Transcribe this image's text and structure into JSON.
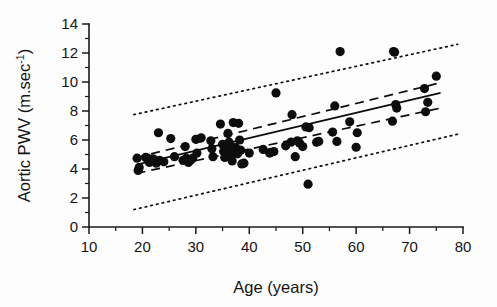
{
  "chart_data": {
    "type": "scatter",
    "title": "",
    "xlabel": "Age (years)",
    "ylabel": "Aortic PWV (m.sec-1)",
    "ylabel_base": "Aortic PWV (m.sec",
    "ylabel_sup": "-1",
    "ylabel_close": ")",
    "xlim": [
      10,
      80
    ],
    "ylim": [
      0,
      14
    ],
    "xticks": [
      10,
      20,
      30,
      40,
      50,
      60,
      70,
      80
    ],
    "xtick_labels": [
      "10",
      "20",
      "30",
      "40",
      "50",
      "60",
      "70",
      "80"
    ],
    "xminor": [
      15,
      25,
      35,
      45,
      55,
      65,
      75
    ],
    "yticks": [
      0,
      2,
      4,
      6,
      8,
      10,
      12,
      14
    ],
    "ytick_labels": [
      "0",
      "2",
      "4",
      "6",
      "8",
      "10",
      "12",
      "14"
    ],
    "yminor": [
      1,
      3,
      5,
      7,
      9,
      11,
      13
    ],
    "grid": false,
    "legend": "none",
    "marker_color": "#0d0d0d",
    "marker_size": 4.6,
    "x": [
      19.0,
      19.2,
      19.4,
      20.6,
      21.0,
      21.3,
      22.0,
      22.3,
      22.6,
      23.0,
      23.2,
      24.0,
      25.3,
      26.0,
      27.6,
      28.0,
      28.2,
      28.6,
      29.0,
      29.4,
      30.0,
      30.2,
      31.0,
      32.8,
      33.0,
      33.2,
      34.6,
      35.0,
      35.2,
      35.4,
      35.8,
      36.0,
      36.2,
      36.4,
      36.6,
      36.8,
      37.0,
      37.4,
      37.8,
      38.0,
      38.2,
      38.4,
      38.6,
      39.0,
      40.0,
      42.6,
      43.8,
      44.0,
      44.6,
      45.0,
      46.8,
      47.8,
      48.0,
      48.6,
      49.0,
      49.4,
      50.0,
      50.6,
      51.0,
      51.2,
      52.6,
      53.0,
      55.6,
      56.0,
      56.4,
      57.0,
      58.8,
      60.0,
      60.2,
      66.8,
      67.0,
      67.2,
      67.4,
      67.6,
      72.8,
      73.0,
      73.4,
      75.0
    ],
    "y": [
      4.75,
      3.9,
      4.1,
      4.8,
      4.75,
      4.45,
      4.7,
      4.55,
      4.4,
      6.5,
      4.6,
      4.5,
      6.1,
      4.85,
      4.6,
      5.55,
      4.75,
      4.45,
      4.6,
      4.75,
      6.05,
      5.1,
      6.15,
      5.95,
      5.4,
      4.85,
      7.1,
      5.7,
      5.2,
      4.8,
      5.25,
      6.45,
      5.85,
      5.45,
      5.0,
      4.55,
      7.2,
      5.5,
      5.05,
      7.15,
      6.0,
      5.3,
      4.35,
      4.4,
      5.1,
      5.35,
      5.1,
      5.15,
      5.2,
      9.25,
      5.6,
      5.85,
      7.75,
      4.85,
      5.95,
      5.8,
      5.55,
      6.9,
      2.95,
      6.85,
      5.85,
      5.9,
      6.55,
      8.35,
      5.9,
      12.1,
      7.25,
      5.5,
      6.5,
      7.3,
      12.1,
      12.05,
      8.45,
      8.2,
      9.55,
      7.95,
      8.6,
      10.4
    ],
    "regression": {
      "name": "regression line",
      "style": "solid",
      "x_start": 18.9,
      "x_end": 75.8,
      "y_start": 4.3,
      "y_end": 9.25
    },
    "confidence_band": {
      "name": "95% confidence interval",
      "style": "dashed",
      "upper": {
        "x_start": 18.9,
        "y_start": 4.8,
        "x_end": 75.8,
        "y_end": 9.95
      },
      "lower": {
        "x_start": 18.9,
        "y_start": 3.7,
        "x_end": 75.8,
        "y_end": 8.2
      }
    },
    "prediction_band": {
      "name": "95% prediction interval",
      "style": "dotted",
      "upper": {
        "x_start": 18.4,
        "y_start": 7.75,
        "x_end": 79.0,
        "y_end": 12.6
      },
      "lower": {
        "x_start": 18.4,
        "y_start": 1.2,
        "x_end": 79.0,
        "y_end": 6.4
      }
    }
  }
}
